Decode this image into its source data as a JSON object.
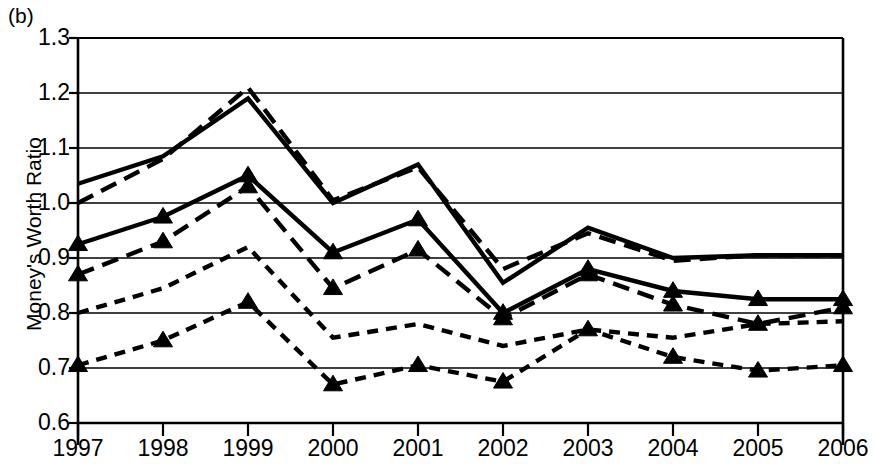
{
  "panel": {
    "label": "(b)"
  },
  "axes": {
    "ylabel": "Money's Worth Ratio",
    "xlabel": "",
    "y_ticks": [
      "1.3",
      "1.2",
      "1.1",
      "1.0",
      "0.9",
      "0.8",
      "0.7",
      "0.6"
    ],
    "x_ticks": [
      "1997",
      "1998",
      "1999",
      "2000",
      "2001",
      "2002",
      "2003",
      "2004",
      "2005",
      "2006"
    ],
    "ylim": [
      0.6,
      1.3
    ],
    "grid": "horizontal"
  },
  "style": {
    "line_color": "#000000",
    "grid_color": "#000000",
    "background": "#ffffff"
  },
  "chart_data": {
    "type": "line",
    "title": "",
    "subtitle": "",
    "xlabel": "",
    "ylabel": "Money's Worth Ratio",
    "x": [
      1997,
      1998,
      1999,
      2000,
      2001,
      2002,
      2003,
      2004,
      2005,
      2006
    ],
    "categories": [
      "1997",
      "1998",
      "1999",
      "2000",
      "2001",
      "2002",
      "2003",
      "2004",
      "2005",
      "2006"
    ],
    "ylim": [
      0.6,
      1.3
    ],
    "xlim": [
      1997,
      2006
    ],
    "grid": true,
    "legend": "none",
    "annotations": [
      "(b)"
    ],
    "series": [
      {
        "name": "series-1-solid-upper",
        "style": "solid",
        "marker": "none",
        "values": [
          1.035,
          1.085,
          1.19,
          1.0,
          1.07,
          0.855,
          0.955,
          0.9,
          0.905,
          0.905
        ]
      },
      {
        "name": "series-2-longdash-upper",
        "style": "long-dash",
        "marker": "none",
        "values": [
          1.0,
          1.08,
          1.21,
          1.005,
          1.065,
          0.88,
          0.945,
          0.895,
          0.905,
          0.905
        ]
      },
      {
        "name": "series-3-solid-triangle",
        "style": "solid",
        "marker": "triangle",
        "values": [
          0.925,
          0.975,
          1.05,
          0.91,
          0.97,
          0.8,
          0.88,
          0.84,
          0.825,
          0.825
        ]
      },
      {
        "name": "series-4-longdash-triangle",
        "style": "long-dash",
        "marker": "triangle",
        "values": [
          0.87,
          0.93,
          1.03,
          0.845,
          0.915,
          0.79,
          0.87,
          0.815,
          0.78,
          0.81
        ]
      },
      {
        "name": "series-5-shortdash-upper",
        "style": "short-dash",
        "marker": "none",
        "values": [
          0.8,
          0.845,
          0.92,
          0.755,
          0.78,
          0.74,
          0.77,
          0.755,
          0.78,
          0.785
        ]
      },
      {
        "name": "series-6-shortdash-triangle",
        "style": "short-dash",
        "marker": "triangle",
        "values": [
          0.705,
          0.75,
          0.82,
          0.67,
          0.705,
          0.675,
          0.77,
          0.72,
          0.695,
          0.705
        ]
      }
    ]
  }
}
